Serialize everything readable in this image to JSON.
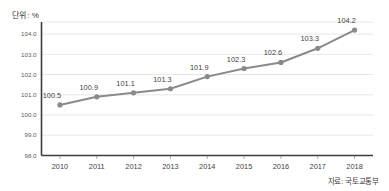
{
  "unit_title": "단위 : %",
  "source_note": "자료: 국토교통부",
  "colors": {
    "series": "#8a8a8a",
    "gridline": "#e2e2e2",
    "axis": "#3c3c3c",
    "background": "#ffffff",
    "label_text": "#3f3f3f"
  },
  "chart_data": {
    "type": "line",
    "title": "단위 : %",
    "subtitle": "",
    "xlabel": "",
    "ylabel": "",
    "categories": [
      "2010",
      "2011",
      "2012",
      "2013",
      "2014",
      "2015",
      "2016",
      "2017",
      "2018"
    ],
    "values": [
      100.5,
      100.9,
      101.1,
      101.3,
      101.9,
      102.3,
      102.6,
      103.3,
      104.2
    ],
    "data_labels": [
      "100.5",
      "100.9",
      "101.1",
      "101.3",
      "101.9",
      "102.3",
      "102.6",
      "103.3",
      "104.2"
    ],
    "series": [
      {
        "name": "지수",
        "values": [
          100.5,
          100.9,
          101.1,
          101.3,
          101.9,
          102.3,
          102.6,
          103.3,
          104.2
        ]
      }
    ],
    "ylim": [
      98.0,
      104.6
    ],
    "yticks": [
      98.0,
      99.0,
      100.0,
      101.0,
      102.0,
      103.0,
      104.0
    ],
    "ytick_labels": [
      "98.0",
      "99.0",
      "100.0",
      "101.0",
      "102.0",
      "103.0",
      "104.0"
    ],
    "grid": true,
    "grid_axis": "y",
    "legend": false,
    "legend_position": "none",
    "markers": true,
    "annotations": [
      "자료: 국토교통부"
    ]
  }
}
